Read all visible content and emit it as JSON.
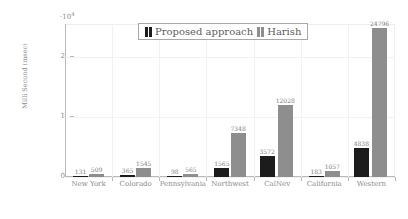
{
  "chart_data": {
    "type": "bar",
    "title": "",
    "xlabel": "",
    "ylabel": "Milli Second (msec)",
    "y_multiplier": "·10",
    "y_multiplier_exp": "4",
    "ylim": [
      0,
      25500
    ],
    "ytick_labels": [
      "0",
      "1",
      "2"
    ],
    "ytick_values": [
      0,
      10000,
      20000
    ],
    "grid": true,
    "legend_position": "top-center",
    "categories": [
      "New York",
      "Colorado",
      "Pennsylvania",
      "Northwest",
      "CalNev",
      "California",
      "Western"
    ],
    "series": [
      {
        "name": "Proposed approach",
        "color": "#1c1c1c",
        "values": [
          131,
          365,
          98,
          1565,
          3572,
          183,
          4838
        ],
        "labels": [
          "131",
          "365",
          "98",
          "1565",
          "3572",
          "183",
          "4838"
        ]
      },
      {
        "name": "Harish",
        "color": "#8e8e8e",
        "values": [
          509,
          1545,
          565,
          7348,
          12028,
          1057,
          24796
        ],
        "labels": [
          "509",
          "1545",
          "565",
          "7348",
          "12028",
          "1057",
          "24796"
        ]
      }
    ]
  },
  "legend": {
    "entries": [
      {
        "label": "Proposed approach"
      },
      {
        "label": "Harish"
      }
    ]
  }
}
